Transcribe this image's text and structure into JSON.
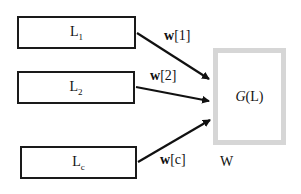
{
  "diagram": {
    "inputs": [
      {
        "label": "L",
        "sub": "1",
        "weight_bold": "w",
        "weight_index": "[1]"
      },
      {
        "label": "L",
        "sub": "2",
        "weight_bold": "w",
        "weight_index": "[2]"
      },
      {
        "label": "L",
        "sub": "c",
        "weight_bold": "w",
        "weight_index": "[c]"
      }
    ],
    "output": {
      "func": "G",
      "arg": "(L)",
      "caption": "W"
    },
    "colors": {
      "box_border": "#1a1a1a",
      "output_border": "#d6d6d6",
      "arrow": "#111111"
    }
  }
}
